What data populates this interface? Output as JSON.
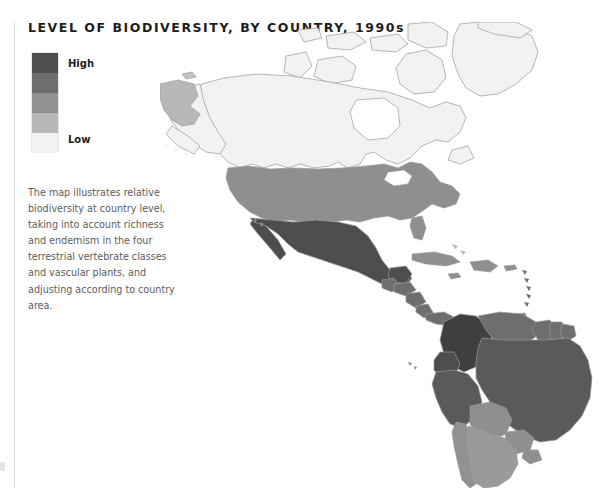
{
  "page": {
    "title": "LEVEL OF BIODIVERSITY, BY COUNTRY, 1990s",
    "background_color": "#ffffff",
    "text_color": "#1d1d1d"
  },
  "legend": {
    "name": "biodiversity-scale",
    "high_label": "High",
    "low_label": "Low",
    "orientation": "vertical",
    "steps": [
      {
        "rank": 5,
        "level": "High",
        "color": "#4d4d4d"
      },
      {
        "rank": 4,
        "level": "Medium-high",
        "color": "#6e6e6e"
      },
      {
        "rank": 3,
        "level": "Medium",
        "color": "#919191"
      },
      {
        "rank": 2,
        "level": "Medium-low",
        "color": "#b8b8b8"
      },
      {
        "rank": 1,
        "level": "Low",
        "color": "#f2f2f2"
      }
    ]
  },
  "caption": {
    "text": "The map illustrates relative biodiversity at country level, taking into account richness and endemism in the four terrestrial vertebrate classes and vascular plants, and adjusting according to country area."
  },
  "map": {
    "name": "biodiversity-choropleth-americas",
    "projection": "world",
    "region_shown": "Americas",
    "outline_color": "#9a9a9a",
    "ocean_color": "#ffffff",
    "countries": [
      {
        "name": "Greenland",
        "level": "Low",
        "color": "#f2f2f2"
      },
      {
        "name": "Canada",
        "level": "Low",
        "color": "#f2f2f2"
      },
      {
        "name": "Alaska (USA)",
        "level": "Low",
        "color": "#f2f2f2"
      },
      {
        "name": "Russia (east)",
        "level": "Medium-low",
        "color": "#b8b8b8"
      },
      {
        "name": "United States",
        "level": "Medium",
        "color": "#8f8f8f"
      },
      {
        "name": "Mexico",
        "level": "High",
        "color": "#4d4d4d"
      },
      {
        "name": "Guatemala",
        "level": "Medium-high",
        "color": "#6e6e6e"
      },
      {
        "name": "Honduras",
        "level": "Medium-high",
        "color": "#6e6e6e"
      },
      {
        "name": "Nicaragua",
        "level": "Medium-high",
        "color": "#6e6e6e"
      },
      {
        "name": "Costa Rica",
        "level": "Medium-high",
        "color": "#6e6e6e"
      },
      {
        "name": "Panama",
        "level": "Medium-high",
        "color": "#6e6e6e"
      },
      {
        "name": "Cuba",
        "level": "Medium",
        "color": "#8f8f8f"
      },
      {
        "name": "Hispaniola",
        "level": "Medium",
        "color": "#8f8f8f"
      },
      {
        "name": "Colombia",
        "level": "High",
        "color": "#3f3f3f"
      },
      {
        "name": "Venezuela",
        "level": "Medium-high",
        "color": "#6e6e6e"
      },
      {
        "name": "Guyana",
        "level": "Medium-high",
        "color": "#6e6e6e"
      },
      {
        "name": "Suriname",
        "level": "Medium-high",
        "color": "#6e6e6e"
      },
      {
        "name": "Ecuador",
        "level": "High",
        "color": "#4d4d4d"
      },
      {
        "name": "Peru",
        "level": "High",
        "color": "#5a5a5a"
      },
      {
        "name": "Brazil",
        "level": "High",
        "color": "#5a5a5a"
      },
      {
        "name": "Bolivia",
        "level": "Medium",
        "color": "#8f8f8f"
      },
      {
        "name": "Paraguay",
        "level": "Medium",
        "color": "#8f8f8f"
      },
      {
        "name": "Chile",
        "level": "Medium",
        "color": "#919191"
      },
      {
        "name": "Argentina",
        "level": "Medium",
        "color": "#9a9a9a"
      },
      {
        "name": "Uruguay",
        "level": "Medium",
        "color": "#8f8f8f"
      }
    ]
  }
}
